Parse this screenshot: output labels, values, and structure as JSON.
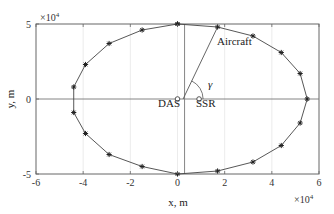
{
  "chart_data": {
    "type": "line",
    "title": "",
    "xlabel": "x, m",
    "ylabel": "y, m",
    "x_multiplier": "×10^4",
    "y_multiplier": "×10^4",
    "xlim": [
      -6,
      6
    ],
    "ylim": [
      -5,
      5
    ],
    "xticks": [
      -6,
      -4,
      -2,
      0,
      2,
      4,
      6
    ],
    "yticks": [
      -5,
      0,
      5
    ],
    "grid": true,
    "legend": null,
    "series": [
      {
        "name": "Aircraft trajectory",
        "marker": "asterisk",
        "units": "x10^4 m",
        "x": [
          0.0,
          1.7,
          3.2,
          4.4,
          5.2,
          5.5,
          5.2,
          4.4,
          3.2,
          1.7,
          0.0,
          -1.5,
          -2.9,
          -3.9,
          -4.4,
          -4.4,
          -3.9,
          -2.9,
          -1.5,
          0.0
        ],
        "y": [
          5.0,
          4.8,
          4.2,
          3.1,
          1.7,
          0.0,
          -1.6,
          -3.1,
          -4.2,
          -4.8,
          -5.0,
          -4.5,
          -3.7,
          -2.3,
          -0.9,
          0.8,
          2.3,
          3.7,
          4.6,
          5.0
        ]
      }
    ],
    "annotations": [
      {
        "text": "DAS",
        "x": 0.0,
        "y": 0.0,
        "marker": "circle"
      },
      {
        "text": "SSR",
        "x": 1.0,
        "y": 0.0,
        "marker": "circle"
      },
      {
        "text": "Aircraft",
        "x": 1.7,
        "y": 4.8,
        "note": "line from SSR to aircraft"
      },
      {
        "text": "γ",
        "x": 1.0,
        "y": 0.0,
        "note": "angle arc at SSR between x-axis and aircraft line"
      }
    ],
    "reference_lines": [
      {
        "type": "horizontal",
        "y": 0
      },
      {
        "type": "vertical",
        "x": 0.3
      }
    ]
  },
  "labels": {
    "xlabel": "x, m",
    "ylabel": "y, m",
    "x_mult_base": "×10",
    "x_mult_exp": "4",
    "y_mult_base": "×10",
    "y_mult_exp": "4",
    "das": "DAS",
    "ssr": "SSR",
    "aircraft": "Aircraft",
    "gamma": "γ",
    "xtick_labels": [
      "-6",
      "-4",
      "-2",
      "0",
      "2",
      "4",
      "6"
    ],
    "ytick_labels": [
      "-5",
      "0",
      "5"
    ]
  }
}
